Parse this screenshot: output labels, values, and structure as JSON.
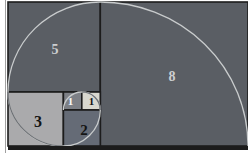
{
  "figure": {
    "type": "fibonacci-golden-spiral-diagram",
    "squares": {
      "s5": {
        "label": "5",
        "fill": "#5a5e64",
        "label_color": "#ccced0"
      },
      "s8": {
        "label": "8",
        "fill": "#5a5e64",
        "label_color": "#ccced0"
      },
      "s3": {
        "label": "3",
        "fill": "#aaaaac",
        "label_color": "#141414"
      },
      "s2": {
        "label": "2",
        "fill": "#656b76",
        "label_color": "#141414"
      },
      "s1l": {
        "label": "1",
        "fill": "#7d8086",
        "label_color": "#fafafa"
      },
      "s1r": {
        "label": "1",
        "fill": "#d9d8cf",
        "label_color": "#141414"
      }
    },
    "spiral": {
      "color_on_dark": "#c9cccd",
      "color_on_light": "#6e7175"
    },
    "frame": {
      "page_bg": "#ffffff",
      "border_color": "#1c1c1c",
      "left_rule_color": "#a0a0a0"
    }
  }
}
